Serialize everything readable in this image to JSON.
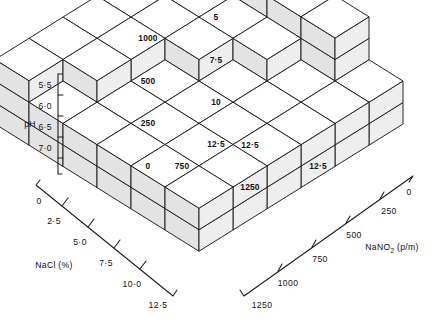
{
  "figure": {
    "type": "3d-block-surface"
  },
  "axes": {
    "vertical": {
      "title": "pH",
      "ticks": [
        "5·5",
        "6·0",
        "6·5",
        "7·0"
      ]
    },
    "left": {
      "title": "NaCl (%)",
      "ticks": [
        "0",
        "2·5",
        "5·0",
        "7·5",
        "10·0",
        "12·5"
      ]
    },
    "right": {
      "title_main": "NaNO",
      "title_sub": "2",
      "title_tail": " (p/m)",
      "title_full": "NaNO2 (p/m)",
      "ticks": [
        "0",
        "250",
        "500",
        "750",
        "1000",
        "1250"
      ]
    }
  },
  "chart_data": {
    "type": "bar",
    "title": "",
    "xlabel": "NaNO2 (p/m)",
    "ylabel": "pH",
    "zlabel": "NaCl (%)",
    "x": [
      0,
      250,
      500,
      750,
      1000,
      1250
    ],
    "z": [
      0,
      2.5,
      5.0,
      7.5,
      10.0,
      12.5
    ],
    "ylim": [
      5.5,
      7.0
    ],
    "grid": false,
    "legend": null,
    "note": "heights[row=NaCl index][col=NaNO2 index]; 1 block = 0.5 pH step",
    "heights": [
      [
        4,
        3,
        3,
        3,
        3,
        3
      ],
      [
        4,
        3,
        3,
        3,
        3,
        2
      ],
      [
        4,
        3,
        3,
        2,
        2,
        2
      ],
      [
        4,
        3,
        2,
        2,
        2,
        2
      ],
      [
        4,
        2,
        2,
        2,
        2,
        2
      ],
      [
        2,
        2,
        2,
        2,
        2,
        2
      ]
    ],
    "annotations": [
      {
        "id": "a1",
        "nacl": "2·5",
        "nano2": "1250"
      },
      {
        "id": "a2",
        "nacl": "5",
        "nano2": "1000"
      },
      {
        "id": "a3",
        "nacl": "7·5",
        "nano2": "500"
      },
      {
        "id": "a4",
        "nacl": "10",
        "nano2": "250"
      },
      {
        "id": "a5",
        "nacl": "12·5",
        "nano2": "0"
      },
      {
        "id": "a6",
        "nacl": "12·5",
        "nano2": "750"
      },
      {
        "id": "a7",
        "nacl": "12·5",
        "nano2": "1250"
      }
    ]
  },
  "cell_labels": {
    "pair_a_left": "2·5",
    "pair_a_right": "1250",
    "pair_b_left": "5",
    "pair_b_right": "1000",
    "pair_c_left": "7·5",
    "pair_c_right": "500",
    "pair_d_left": "10",
    "pair_d_right": "250",
    "pair_e_left": "12·5",
    "pair_e_right": "0",
    "pair_f_left": "12·5",
    "pair_f_right": "750",
    "pair_g_left": "12·5",
    "pair_g_right": "1250"
  },
  "colors": {
    "ink": "#1a1a1a",
    "top_face": "#ffffff",
    "left_face": "#eeeeee",
    "right_face": "#e3e3e3",
    "background": "#ffffff"
  }
}
